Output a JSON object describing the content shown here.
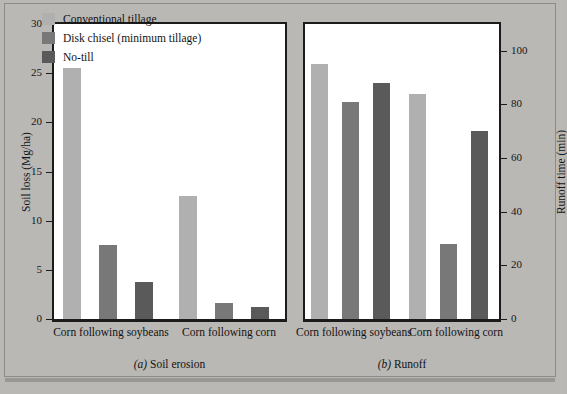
{
  "figure": {
    "background_color": "#bab8b5",
    "plot_background_color": "#ffffff"
  },
  "legend": {
    "position": "inside-panel-a-top-left",
    "entries": [
      {
        "label": "Conventional tillage",
        "color": "#b0b0b0"
      },
      {
        "label": "Disk chisel (minimum tillage)",
        "color": "#787878"
      },
      {
        "label": "No-till",
        "color": "#5a5a5a"
      }
    ]
  },
  "panels": {
    "a": {
      "caption_tag": "(a)",
      "caption_text": "Soil erosion",
      "ylabel": "Soil loss (Mg/ha)",
      "yticks": [
        "0",
        "5",
        "10",
        "15",
        "20",
        "25",
        "30"
      ],
      "groups": [
        "Corn following soybeans",
        "Corn following corn"
      ]
    },
    "b": {
      "caption_tag": "(b)",
      "caption_text": "Runoff",
      "ylabel": "Runoff time (min)",
      "yticks": [
        "0",
        "20",
        "40",
        "60",
        "80",
        "100"
      ],
      "groups": [
        "Corn following soybeans",
        "Corn following corn"
      ]
    }
  },
  "chart_data": [
    {
      "type": "bar",
      "panel": "a",
      "title": "(a) Soil erosion",
      "xlabel": "",
      "ylabel": "Soil loss (Mg/ha)",
      "ylim": [
        0,
        30
      ],
      "ytick_values": [
        0,
        5,
        10,
        15,
        20,
        25,
        30
      ],
      "grid": false,
      "legend_position": "upper center inside axes",
      "categories": [
        "Corn following soybeans",
        "Corn following corn"
      ],
      "series": [
        {
          "name": "Conventional tillage",
          "color": "#b0b0b0",
          "values": [
            25.5,
            12.5
          ]
        },
        {
          "name": "Disk chisel (minimum tillage)",
          "color": "#787878",
          "values": [
            7.5,
            1.6
          ]
        },
        {
          "name": "No-till",
          "color": "#5a5a5a",
          "values": [
            3.8,
            1.2
          ]
        }
      ]
    },
    {
      "type": "bar",
      "panel": "b",
      "title": "(b) Runoff",
      "xlabel": "",
      "ylabel": "Runoff time (min)",
      "ylim": [
        0,
        110
      ],
      "ytick_values": [
        0,
        20,
        40,
        60,
        80,
        100
      ],
      "grid": false,
      "legend_position": "none",
      "categories": [
        "Corn following soybeans",
        "Corn following corn"
      ],
      "series": [
        {
          "name": "Conventional tillage",
          "color": "#b0b0b0",
          "values": [
            95,
            84
          ]
        },
        {
          "name": "Disk chisel (minimum tillage)",
          "color": "#787878",
          "values": [
            81,
            28
          ]
        },
        {
          "name": "No-till",
          "color": "#5a5a5a",
          "values": [
            88,
            70
          ]
        }
      ]
    }
  ]
}
